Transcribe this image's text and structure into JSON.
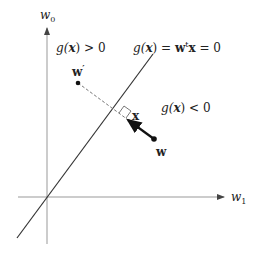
{
  "axes": {
    "y_label": "w",
    "y_sub": "0",
    "x_label": "w",
    "x_sub": "1"
  },
  "regions": {
    "positive": {
      "g": "g(",
      "x": "x",
      "rest": ") > 0"
    },
    "negative": {
      "g": "g(",
      "x": "x",
      "rest": ") < 0"
    }
  },
  "boundary": {
    "g": "g(",
    "x": "x",
    "mid": ") = ",
    "w": "w",
    "sup": "t",
    "x2": "x",
    "end": " = 0"
  },
  "points": {
    "w_prime": {
      "label": "w",
      "prime": "′"
    },
    "w": {
      "label": "w"
    },
    "x": {
      "label": "x"
    }
  },
  "colors": {
    "axis": "#888888",
    "line": "#333333",
    "dashed": "#666666",
    "vector": "#111111"
  }
}
